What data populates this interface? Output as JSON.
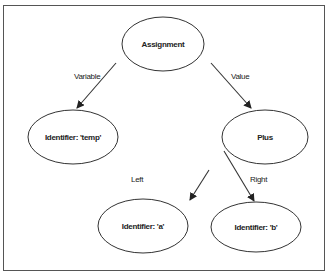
{
  "diagram": {
    "type": "abstract-syntax-tree",
    "nodes": [
      {
        "id": "assignment",
        "label": "Assignment"
      },
      {
        "id": "temp",
        "label": "Identifier: 'temp'"
      },
      {
        "id": "plus",
        "label": "Plus"
      },
      {
        "id": "a",
        "label": "Identifier: 'a'"
      },
      {
        "id": "b",
        "label": "Identifier: 'b'"
      }
    ],
    "edges": [
      {
        "from": "assignment",
        "to": "temp",
        "label": "Variable"
      },
      {
        "from": "assignment",
        "to": "plus",
        "label": "Value"
      },
      {
        "from": "plus",
        "to": "a",
        "label": "Left"
      },
      {
        "from": "plus",
        "to": "b",
        "label": "Right"
      }
    ],
    "colors": {
      "stroke": "#333333",
      "background": "#ffffff",
      "frame": "#555555"
    }
  }
}
